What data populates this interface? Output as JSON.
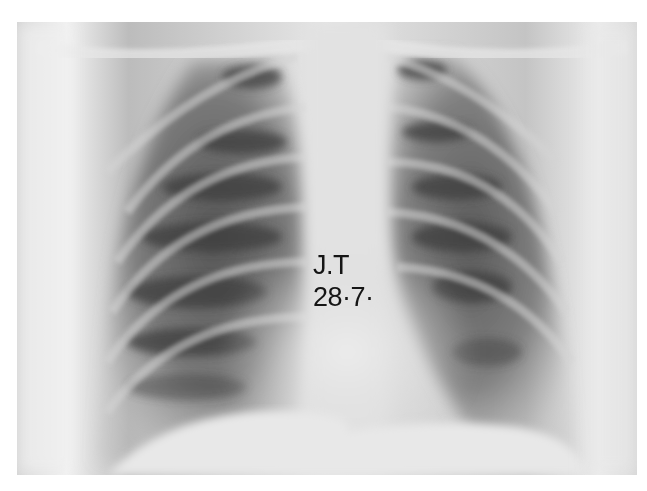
{
  "image": {
    "subject": "Frontal chest radiograph (PA)",
    "annotation": {
      "initials": "J.T",
      "date": "28·7·"
    },
    "tones": {
      "background": "#ffffff",
      "soft_tissue": "#d8d8d8",
      "lung_dark": "#4a4a4a",
      "lung_mid": "#8a8a8a",
      "mediastinum": "#e4e4e4",
      "text": "#151515"
    }
  }
}
